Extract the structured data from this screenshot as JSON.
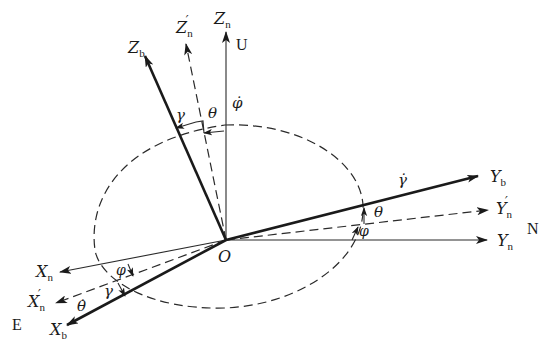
{
  "diagram": {
    "type": "coordinate-frame-rotation",
    "origin": {
      "label": "O"
    },
    "axes": {
      "Zn": {
        "base": "Z",
        "sub": "n",
        "prime": false,
        "style": "thin"
      },
      "Zn_prime": {
        "base": "Z",
        "sub": "n",
        "prime": true,
        "style": "dashed"
      },
      "Zb": {
        "base": "Z",
        "sub": "b",
        "prime": false,
        "style": "thick"
      },
      "Yn": {
        "base": "Y",
        "sub": "n",
        "prime": false,
        "style": "thin"
      },
      "Yn_prime": {
        "base": "Y",
        "sub": "n",
        "prime": true,
        "style": "dashed"
      },
      "Yb": {
        "base": "Y",
        "sub": "b",
        "prime": false,
        "style": "thick"
      },
      "Xn": {
        "base": "X",
        "sub": "n",
        "prime": false,
        "style": "thin"
      },
      "Xn_prime": {
        "base": "X",
        "sub": "n",
        "prime": true,
        "style": "dashed"
      },
      "Xb": {
        "base": "X",
        "sub": "b",
        "prime": false,
        "style": "thick"
      }
    },
    "directions": {
      "up": "U",
      "north": "N",
      "east": "E"
    },
    "angles": {
      "gamma": "γ",
      "theta": "θ",
      "phi": "φ",
      "phi_dot": "φ̇",
      "gamma_dot": "γ̇",
      "theta_dot": "θ̇"
    },
    "prime_mark": "′"
  }
}
